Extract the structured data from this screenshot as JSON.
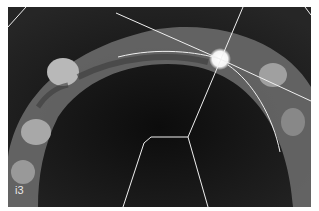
{
  "image": {
    "description": "Axial CT slice of maxillary dental arch with implant planning lines",
    "panel_label": "i3",
    "overlay_color": "#f0f0f0",
    "background_color": "#1a1a1a"
  }
}
